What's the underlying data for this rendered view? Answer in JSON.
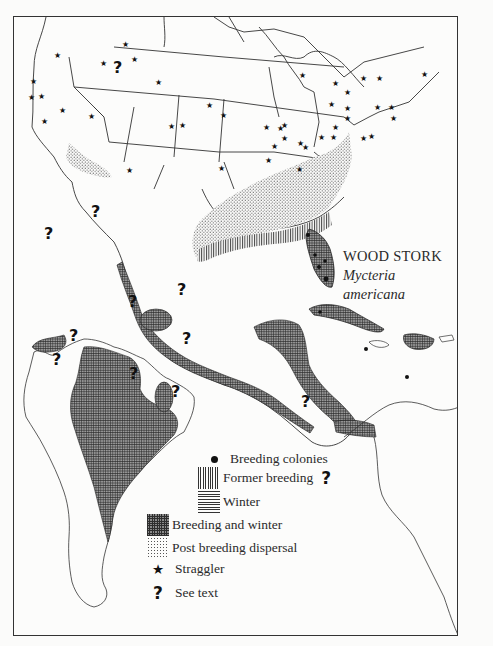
{
  "figure": {
    "common_name": "WOOD STORK",
    "scientific_name": "Mycteria americana",
    "region": "North, Central and South America"
  },
  "legend": {
    "items": [
      {
        "key": "breeding_colonies",
        "label": "Breeding colonies",
        "symbol": "filled-circle"
      },
      {
        "key": "former_breeding",
        "label": "Former breeding",
        "symbol": "vertical-hatch",
        "suffix": "?"
      },
      {
        "key": "winter",
        "label": "Winter",
        "symbol": "horizontal-hatch"
      },
      {
        "key": "breeding_and_winter",
        "label": "Breeding and winter",
        "symbol": "cross-hatch"
      },
      {
        "key": "postbreeding_dispersal",
        "label": "Post breeding dispersal",
        "symbol": "stipple"
      },
      {
        "key": "straggler",
        "label": "Straggler",
        "symbol": "star",
        "glyph": "★"
      },
      {
        "key": "see_text",
        "label": "See text",
        "symbol": "question-mark",
        "glyph": "?"
      }
    ]
  },
  "map_marks": {
    "see_text_glyph": "?",
    "straggler_glyph": "★",
    "see_text_count": 11,
    "straggler_count_approx": 45
  },
  "colors": {
    "ink": "#222222",
    "paper": "#fcfcfb",
    "range_fill": "#4a4a4a"
  }
}
